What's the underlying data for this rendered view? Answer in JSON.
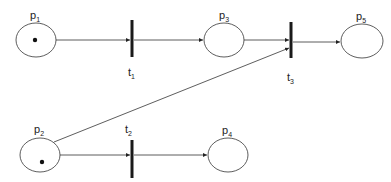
{
  "diagram": {
    "type": "petri-net",
    "colors": {
      "stroke": "#333333",
      "bar": "#1a1a1a",
      "token": "#111111",
      "background": "#ffffff"
    },
    "places": [
      {
        "id": "p1",
        "base": "p",
        "sub": "1",
        "cx": 36,
        "cy": 40,
        "rx": 20,
        "ry": 17,
        "tokens": 1,
        "label_x": 30,
        "label_y": 19,
        "token_x": 35,
        "token_y": 40
      },
      {
        "id": "p2",
        "base": "p",
        "sub": "2",
        "cx": 40,
        "cy": 155,
        "rx": 20,
        "ry": 17,
        "tokens": 1,
        "label_x": 34,
        "label_y": 133,
        "token_x": 42,
        "token_y": 162
      },
      {
        "id": "p3",
        "base": "p",
        "sub": "3",
        "cx": 224,
        "cy": 40,
        "rx": 20,
        "ry": 17,
        "tokens": 0,
        "label_x": 219,
        "label_y": 19
      },
      {
        "id": "p4",
        "base": "p",
        "sub": "4",
        "cx": 228,
        "cy": 155,
        "rx": 20,
        "ry": 17,
        "tokens": 0,
        "label_x": 222,
        "label_y": 134
      },
      {
        "id": "p5",
        "base": "p",
        "sub": "5",
        "cx": 362,
        "cy": 41,
        "rx": 21,
        "ry": 17,
        "tokens": 0,
        "label_x": 356,
        "label_y": 20
      }
    ],
    "transitions": [
      {
        "id": "t1",
        "base": "t",
        "sub": "1",
        "x": 132,
        "y1": 20,
        "y2": 57,
        "label_x": 128,
        "label_y": 76
      },
      {
        "id": "t2",
        "base": "t",
        "sub": "2",
        "x": 132,
        "y1": 140,
        "y2": 178,
        "label_x": 125,
        "label_y": 133
      },
      {
        "id": "t3",
        "base": "t",
        "sub": "3",
        "x": 291,
        "y1": 22,
        "y2": 58,
        "label_x": 287,
        "label_y": 81
      }
    ],
    "arcs": [
      {
        "from": "p1",
        "to": "t1",
        "x1": 56,
        "y1": 40,
        "x2": 130,
        "y2": 40
      },
      {
        "from": "t1",
        "to": "p3",
        "x1": 134,
        "y1": 40,
        "x2": 203,
        "y2": 40
      },
      {
        "from": "p3",
        "to": "t3",
        "x1": 244,
        "y1": 40,
        "x2": 289,
        "y2": 40
      },
      {
        "from": "p2",
        "to": "t3",
        "x1": 54,
        "y1": 142,
        "x2": 289,
        "y2": 48
      },
      {
        "from": "t3",
        "to": "p5",
        "x1": 293,
        "y1": 42,
        "x2": 340,
        "y2": 42
      },
      {
        "from": "p2",
        "to": "t2",
        "x1": 60,
        "y1": 155,
        "x2": 130,
        "y2": 155
      },
      {
        "from": "t2",
        "to": "p4",
        "x1": 134,
        "y1": 155,
        "x2": 207,
        "y2": 155
      }
    ]
  }
}
